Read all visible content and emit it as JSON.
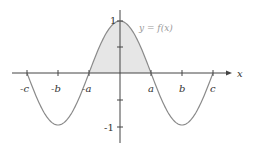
{
  "figure": {
    "curve_label": "y = f(x)",
    "x_axis_label": "x",
    "x_ticks": [
      "-c",
      "-b",
      "-a",
      "a",
      "b",
      "c"
    ],
    "y_ticks": [
      "1",
      "-1"
    ],
    "colors": {
      "curve": "#8a8a8a",
      "axis": "#444444",
      "fill": "#e6e6e6"
    }
  },
  "chart_data": {
    "type": "line",
    "title": "",
    "xlabel": "x",
    "ylabel": "y",
    "series": [
      {
        "name": "y = f(x)",
        "description": "cosine-like curve, max 1 at x=0, zeros at ±a and ±c, minima -1 at ±b"
      }
    ],
    "x_ticks": [
      "-c",
      "-b",
      "-a",
      "a",
      "b",
      "c"
    ],
    "y_ticks": [
      1,
      -1
    ],
    "ylim": [
      -1.2,
      1.1
    ],
    "shaded_region": "area under curve between -a and a"
  }
}
